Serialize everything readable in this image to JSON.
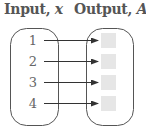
{
  "diagram": {
    "input_title": {
      "label": "Input, ",
      "variable": "x"
    },
    "output_title": {
      "label": "Output, ",
      "variable": "A"
    },
    "inputs": [
      "1",
      "2",
      "3",
      "4"
    ],
    "outputs": [
      "",
      "",
      "",
      ""
    ],
    "colors": {
      "stroke": "#555555",
      "title_text": "#555555",
      "number_text": "#666666",
      "output_box_fill": "#e6e6e6"
    }
  }
}
